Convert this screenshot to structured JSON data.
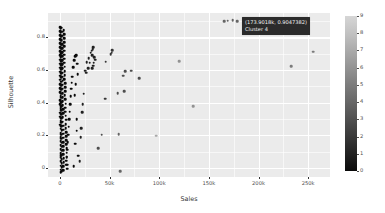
{
  "chart_data": {
    "type": "scatter",
    "title": "",
    "xlabel": "Sales",
    "ylabel": "Silhouette",
    "xlim": [
      -12000,
      272000
    ],
    "ylim": [
      -0.055,
      0.95
    ],
    "grid": true,
    "xticks": [
      0,
      50000,
      100000,
      150000,
      200000,
      250000
    ],
    "xticklabels": [
      "0",
      "50k",
      "100k",
      "150k",
      "200k",
      "250k"
    ],
    "yticks": [
      0,
      0.2,
      0.4,
      0.6,
      0.8
    ],
    "yticklabels": [
      "0",
      "0.2",
      "0.4",
      "0.6",
      "0.8"
    ],
    "legend": {
      "position": "right",
      "type": "colorbar",
      "title": "",
      "ticks": [
        0,
        1,
        2,
        3,
        4,
        5,
        6,
        7,
        8,
        9
      ],
      "ticklabels": [
        "0",
        "1",
        "2",
        "3",
        "4",
        "5",
        "6",
        "7",
        "8",
        "9"
      ],
      "vmin": 0,
      "vmax": 9,
      "colormap": "grayscale-dark-to-light",
      "low_color": "#0a0a0a",
      "high_color": "#d6d6d6"
    },
    "panel_background": "#ebebeb",
    "gridline_color": "#ffffff",
    "point_color_default": "#222222",
    "points": [
      {
        "x": 173901.8,
        "y": 0.9047382,
        "c": 4
      },
      {
        "x": 169000,
        "y": 0.903,
        "c": 4
      },
      {
        "x": 165500,
        "y": 0.901,
        "c": 4
      },
      {
        "x": 178500,
        "y": 0.9,
        "c": 4
      },
      {
        "x": 255000,
        "y": 0.712,
        "c": 5
      },
      {
        "x": 233000,
        "y": 0.623,
        "c": 5
      },
      {
        "x": 120000,
        "y": 0.655,
        "c": 6
      },
      {
        "x": 134000,
        "y": 0.378,
        "c": 6
      },
      {
        "x": 97000,
        "y": 0.197,
        "c": 7
      },
      {
        "x": 80000,
        "y": 0.551,
        "c": 3
      },
      {
        "x": 72000,
        "y": 0.597,
        "c": 3
      },
      {
        "x": 65500,
        "y": 0.592,
        "c": 3
      },
      {
        "x": 64000,
        "y": 0.565,
        "c": 3
      },
      {
        "x": 65000,
        "y": 0.47,
        "c": 3
      },
      {
        "x": 58000,
        "y": 0.458,
        "c": 3
      },
      {
        "x": 59000,
        "y": 0.208,
        "c": 4
      },
      {
        "x": 60500,
        "y": -0.018,
        "c": 4
      },
      {
        "x": 52500,
        "y": 0.722,
        "c": 2
      },
      {
        "x": 52000,
        "y": 0.707,
        "c": 2
      },
      {
        "x": 51000,
        "y": 0.697,
        "c": 2
      },
      {
        "x": 46000,
        "y": 0.652,
        "c": 2
      },
      {
        "x": 45500,
        "y": 0.424,
        "c": 2
      },
      {
        "x": 42000,
        "y": 0.203,
        "c": 3
      },
      {
        "x": 38500,
        "y": 0.121,
        "c": 3
      },
      {
        "x": 33500,
        "y": 0.742,
        "c": 1
      },
      {
        "x": 33000,
        "y": 0.728,
        "c": 1
      },
      {
        "x": 32000,
        "y": 0.718,
        "c": 1
      },
      {
        "x": 31000,
        "y": 0.706,
        "c": 1
      },
      {
        "x": 32500,
        "y": 0.693,
        "c": 1
      },
      {
        "x": 34500,
        "y": 0.68,
        "c": 1
      },
      {
        "x": 35500,
        "y": 0.663,
        "c": 1
      },
      {
        "x": 34000,
        "y": 0.646,
        "c": 1
      },
      {
        "x": 33500,
        "y": 0.628,
        "c": 1
      },
      {
        "x": 32500,
        "y": 0.612,
        "c": 1
      },
      {
        "x": 30000,
        "y": 0.646,
        "c": 1
      },
      {
        "x": 29000,
        "y": 0.672,
        "c": 1
      },
      {
        "x": 28500,
        "y": 0.61,
        "c": 1
      },
      {
        "x": 27000,
        "y": 0.648,
        "c": 1
      },
      {
        "x": 26500,
        "y": 0.585,
        "c": 1
      },
      {
        "x": 25500,
        "y": 0.597,
        "c": 1
      },
      {
        "x": 24000,
        "y": 0.455,
        "c": 1
      },
      {
        "x": 23000,
        "y": 0.39,
        "c": 1
      },
      {
        "x": 22500,
        "y": 0.343,
        "c": 1
      },
      {
        "x": 21500,
        "y": 0.244,
        "c": 1
      },
      {
        "x": 21000,
        "y": 0.19,
        "c": 1
      },
      {
        "x": 20000,
        "y": 0.041,
        "c": 1
      },
      {
        "x": 15500,
        "y": 0.686,
        "c": 0
      },
      {
        "x": 14500,
        "y": 0.659,
        "c": 0
      },
      {
        "x": 13500,
        "y": 0.617,
        "c": 0
      },
      {
        "x": 12500,
        "y": 0.56,
        "c": 0
      },
      {
        "x": 12000,
        "y": 0.522,
        "c": 0
      },
      {
        "x": 11500,
        "y": 0.486,
        "c": 0
      },
      {
        "x": 11000,
        "y": 0.44,
        "c": 0
      },
      {
        "x": 10500,
        "y": 0.392,
        "c": 0
      },
      {
        "x": 10000,
        "y": 0.344,
        "c": 0
      },
      {
        "x": 9500,
        "y": 0.3,
        "c": 0
      },
      {
        "x": 9000,
        "y": 0.252,
        "c": 0
      },
      {
        "x": 8500,
        "y": 0.204,
        "c": 0
      },
      {
        "x": 8000,
        "y": 0.16,
        "c": 0
      },
      {
        "x": 7500,
        "y": 0.112,
        "c": 0
      },
      {
        "x": 7000,
        "y": 0.066,
        "c": 0
      },
      {
        "x": 6500,
        "y": 0.02,
        "c": 0
      },
      {
        "x": 4000,
        "y": 0.845,
        "c": 0
      },
      {
        "x": 4200,
        "y": 0.82,
        "c": 0
      },
      {
        "x": 4400,
        "y": 0.795,
        "c": 0
      },
      {
        "x": 4300,
        "y": 0.77,
        "c": 0
      },
      {
        "x": 4100,
        "y": 0.745,
        "c": 0
      },
      {
        "x": 4500,
        "y": 0.72,
        "c": 0
      },
      {
        "x": 4600,
        "y": 0.695,
        "c": 0
      },
      {
        "x": 4400,
        "y": 0.67,
        "c": 0
      },
      {
        "x": 4200,
        "y": 0.645,
        "c": 0
      },
      {
        "x": 4800,
        "y": 0.62,
        "c": 0
      },
      {
        "x": 5000,
        "y": 0.595,
        "c": 0
      },
      {
        "x": 4700,
        "y": 0.57,
        "c": 0
      },
      {
        "x": 4500,
        "y": 0.545,
        "c": 0
      },
      {
        "x": 5200,
        "y": 0.52,
        "c": 0
      },
      {
        "x": 5400,
        "y": 0.495,
        "c": 0
      },
      {
        "x": 5100,
        "y": 0.47,
        "c": 0
      },
      {
        "x": 4900,
        "y": 0.445,
        "c": 0
      },
      {
        "x": 5600,
        "y": 0.42,
        "c": 0
      },
      {
        "x": 5800,
        "y": 0.395,
        "c": 0
      },
      {
        "x": 5500,
        "y": 0.37,
        "c": 0
      },
      {
        "x": 5300,
        "y": 0.345,
        "c": 0
      },
      {
        "x": 6000,
        "y": 0.32,
        "c": 0
      },
      {
        "x": 6200,
        "y": 0.295,
        "c": 0
      },
      {
        "x": 5900,
        "y": 0.27,
        "c": 0
      },
      {
        "x": 5700,
        "y": 0.245,
        "c": 0
      },
      {
        "x": 6400,
        "y": 0.22,
        "c": 0
      },
      {
        "x": 6600,
        "y": 0.195,
        "c": 0
      },
      {
        "x": 6300,
        "y": 0.17,
        "c": 0
      },
      {
        "x": 6100,
        "y": 0.145,
        "c": 0
      },
      {
        "x": 6800,
        "y": 0.12,
        "c": 0
      },
      {
        "x": 7000,
        "y": 0.095,
        "c": 0
      },
      {
        "x": 6700,
        "y": 0.07,
        "c": 0
      },
      {
        "x": 6500,
        "y": 0.045,
        "c": 0
      },
      {
        "x": 7200,
        "y": 0.02,
        "c": 0
      },
      {
        "x": 7400,
        "y": -0.005,
        "c": 0
      },
      {
        "x": 2000,
        "y": 0.86,
        "c": 0
      },
      {
        "x": 2100,
        "y": 0.835,
        "c": 0
      },
      {
        "x": 2200,
        "y": 0.81,
        "c": 0
      },
      {
        "x": 2000,
        "y": 0.785,
        "c": 0
      },
      {
        "x": 2300,
        "y": 0.76,
        "c": 0
      },
      {
        "x": 2400,
        "y": 0.735,
        "c": 0
      },
      {
        "x": 2200,
        "y": 0.71,
        "c": 0
      },
      {
        "x": 2100,
        "y": 0.685,
        "c": 0
      },
      {
        "x": 2500,
        "y": 0.66,
        "c": 0
      },
      {
        "x": 2600,
        "y": 0.635,
        "c": 0
      },
      {
        "x": 2400,
        "y": 0.61,
        "c": 0
      },
      {
        "x": 2300,
        "y": 0.585,
        "c": 0
      },
      {
        "x": 2700,
        "y": 0.56,
        "c": 0
      },
      {
        "x": 2800,
        "y": 0.535,
        "c": 0
      },
      {
        "x": 2600,
        "y": 0.51,
        "c": 0
      },
      {
        "x": 2500,
        "y": 0.485,
        "c": 0
      },
      {
        "x": 2900,
        "y": 0.46,
        "c": 0
      },
      {
        "x": 3000,
        "y": 0.435,
        "c": 0
      },
      {
        "x": 2800,
        "y": 0.41,
        "c": 0
      },
      {
        "x": 2700,
        "y": 0.385,
        "c": 0
      },
      {
        "x": 3100,
        "y": 0.36,
        "c": 0
      },
      {
        "x": 3200,
        "y": 0.335,
        "c": 0
      },
      {
        "x": 3000,
        "y": 0.31,
        "c": 0
      },
      {
        "x": 2900,
        "y": 0.285,
        "c": 0
      },
      {
        "x": 3300,
        "y": 0.26,
        "c": 0
      },
      {
        "x": 3400,
        "y": 0.235,
        "c": 0
      },
      {
        "x": 3200,
        "y": 0.21,
        "c": 0
      },
      {
        "x": 3100,
        "y": 0.185,
        "c": 0
      },
      {
        "x": 3500,
        "y": 0.16,
        "c": 0
      },
      {
        "x": 3600,
        "y": 0.135,
        "c": 0
      },
      {
        "x": 3400,
        "y": 0.11,
        "c": 0
      },
      {
        "x": 3300,
        "y": 0.085,
        "c": 0
      },
      {
        "x": 3700,
        "y": 0.06,
        "c": 0
      },
      {
        "x": 3800,
        "y": 0.035,
        "c": 0
      },
      {
        "x": 3600,
        "y": 0.01,
        "c": 0
      },
      {
        "x": 3500,
        "y": -0.012,
        "c": 0
      },
      {
        "x": 900,
        "y": 0.855,
        "c": 0
      },
      {
        "x": 950,
        "y": 0.83,
        "c": 0
      },
      {
        "x": 1000,
        "y": 0.805,
        "c": 0
      },
      {
        "x": 900,
        "y": 0.78,
        "c": 0
      },
      {
        "x": 1050,
        "y": 0.755,
        "c": 0
      },
      {
        "x": 1100,
        "y": 0.73,
        "c": 0
      },
      {
        "x": 1000,
        "y": 0.705,
        "c": 0
      },
      {
        "x": 950,
        "y": 0.68,
        "c": 0
      },
      {
        "x": 1150,
        "y": 0.655,
        "c": 0
      },
      {
        "x": 1200,
        "y": 0.63,
        "c": 0
      },
      {
        "x": 1100,
        "y": 0.605,
        "c": 0
      },
      {
        "x": 1050,
        "y": 0.58,
        "c": 0
      },
      {
        "x": 1250,
        "y": 0.555,
        "c": 0
      },
      {
        "x": 1300,
        "y": 0.53,
        "c": 0
      },
      {
        "x": 1200,
        "y": 0.505,
        "c": 0
      },
      {
        "x": 1150,
        "y": 0.48,
        "c": 0
      },
      {
        "x": 1350,
        "y": 0.455,
        "c": 0
      },
      {
        "x": 1400,
        "y": 0.43,
        "c": 0
      },
      {
        "x": 1300,
        "y": 0.405,
        "c": 0
      },
      {
        "x": 1250,
        "y": 0.38,
        "c": 0
      },
      {
        "x": 1450,
        "y": 0.355,
        "c": 0
      },
      {
        "x": 1500,
        "y": 0.33,
        "c": 0
      },
      {
        "x": 1400,
        "y": 0.305,
        "c": 0
      },
      {
        "x": 1350,
        "y": 0.28,
        "c": 0
      },
      {
        "x": 1550,
        "y": 0.255,
        "c": 0
      },
      {
        "x": 1600,
        "y": 0.23,
        "c": 0
      },
      {
        "x": 1500,
        "y": 0.205,
        "c": 0
      },
      {
        "x": 1450,
        "y": 0.18,
        "c": 0
      },
      {
        "x": 1650,
        "y": 0.155,
        "c": 0
      },
      {
        "x": 1700,
        "y": 0.13,
        "c": 0
      },
      {
        "x": 1600,
        "y": 0.105,
        "c": 0
      },
      {
        "x": 1550,
        "y": 0.08,
        "c": 0
      },
      {
        "x": 1750,
        "y": 0.055,
        "c": 0
      },
      {
        "x": 1800,
        "y": 0.03,
        "c": 0
      },
      {
        "x": 1700,
        "y": 0.005,
        "c": 0
      },
      {
        "x": 1650,
        "y": -0.018,
        "c": 0
      },
      {
        "x": 300,
        "y": 0.862,
        "c": 0
      },
      {
        "x": 350,
        "y": 0.84,
        "c": 0
      },
      {
        "x": 400,
        "y": 0.815,
        "c": 0
      },
      {
        "x": 320,
        "y": 0.79,
        "c": 0
      },
      {
        "x": 380,
        "y": 0.765,
        "c": 0
      },
      {
        "x": 450,
        "y": 0.74,
        "c": 0
      },
      {
        "x": 360,
        "y": 0.715,
        "c": 0
      },
      {
        "x": 420,
        "y": 0.69,
        "c": 0
      },
      {
        "x": 500,
        "y": 0.665,
        "c": 0
      },
      {
        "x": 400,
        "y": 0.64,
        "c": 0
      },
      {
        "x": 460,
        "y": 0.615,
        "c": 0
      },
      {
        "x": 530,
        "y": 0.59,
        "c": 0
      },
      {
        "x": 440,
        "y": 0.565,
        "c": 0
      },
      {
        "x": 490,
        "y": 0.54,
        "c": 0
      },
      {
        "x": 560,
        "y": 0.515,
        "c": 0
      },
      {
        "x": 470,
        "y": 0.49,
        "c": 0
      },
      {
        "x": 520,
        "y": 0.465,
        "c": 0
      },
      {
        "x": 590,
        "y": 0.44,
        "c": 0
      },
      {
        "x": 500,
        "y": 0.415,
        "c": 0
      },
      {
        "x": 550,
        "y": 0.39,
        "c": 0
      },
      {
        "x": 620,
        "y": 0.365,
        "c": 0
      },
      {
        "x": 530,
        "y": 0.34,
        "c": 0
      },
      {
        "x": 580,
        "y": 0.315,
        "c": 0
      },
      {
        "x": 650,
        "y": 0.29,
        "c": 0
      },
      {
        "x": 560,
        "y": 0.265,
        "c": 0
      },
      {
        "x": 610,
        "y": 0.24,
        "c": 0
      },
      {
        "x": 680,
        "y": 0.215,
        "c": 0
      },
      {
        "x": 590,
        "y": 0.19,
        "c": 0
      },
      {
        "x": 640,
        "y": 0.165,
        "c": 0
      },
      {
        "x": 710,
        "y": 0.14,
        "c": 0
      },
      {
        "x": 620,
        "y": 0.115,
        "c": 0
      },
      {
        "x": 670,
        "y": 0.09,
        "c": 0
      },
      {
        "x": 740,
        "y": 0.065,
        "c": 0
      },
      {
        "x": 650,
        "y": 0.04,
        "c": 0
      },
      {
        "x": 700,
        "y": 0.015,
        "c": 0
      },
      {
        "x": 770,
        "y": -0.01,
        "c": 0
      },
      {
        "x": 680,
        "y": -0.025,
        "c": 0
      },
      {
        "x": 16500,
        "y": 0.692,
        "c": 0
      },
      {
        "x": 17500,
        "y": 0.64,
        "c": 0
      },
      {
        "x": 18000,
        "y": 0.575,
        "c": 0
      },
      {
        "x": 16000,
        "y": 0.512,
        "c": 0
      },
      {
        "x": 15000,
        "y": 0.448,
        "c": 0
      },
      {
        "x": 17000,
        "y": 0.3,
        "c": 0
      },
      {
        "x": 16800,
        "y": 0.228,
        "c": 0
      },
      {
        "x": 15500,
        "y": 0.148,
        "c": 0
      },
      {
        "x": 18500,
        "y": 0.075,
        "c": 0
      },
      {
        "x": 14000,
        "y": 0.01,
        "c": 0
      }
    ]
  },
  "tooltip": {
    "coords": "(173.9018k, 0.9047382)",
    "cluster": "Cluster 4",
    "background": "#2b2b2b",
    "text_color": "#f2f2f2"
  }
}
